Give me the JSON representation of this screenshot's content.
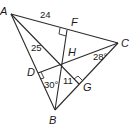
{
  "diagram": {
    "type": "triangle-orthocenter",
    "points": {
      "A": {
        "label": "A",
        "x": 11,
        "y": 14
      },
      "B": {
        "label": "B",
        "x": 55,
        "y": 110
      },
      "C": {
        "label": "C",
        "x": 118,
        "y": 43
      },
      "H": {
        "label": "H",
        "x": 63,
        "y": 60
      },
      "F": {
        "label": "F",
        "x": 67,
        "y": 30
      },
      "D": {
        "label": "D",
        "x": 38,
        "y": 73
      },
      "G": {
        "label": "G",
        "x": 79,
        "y": 84
      }
    },
    "measurements": {
      "AF": "24",
      "AH": "25",
      "HG": "11",
      "angle_DBH": "30°",
      "angle_HCG": "28°"
    },
    "right_angles": [
      "F",
      "D",
      "G"
    ]
  }
}
